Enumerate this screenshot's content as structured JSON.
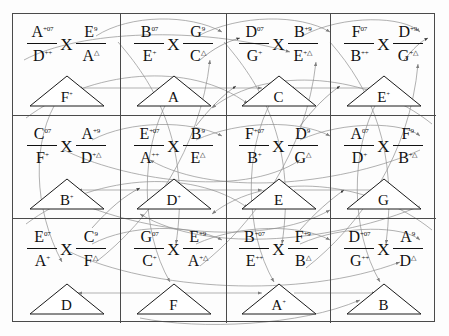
{
  "diagram": {
    "grid": {
      "rows": 3,
      "cols": 4
    },
    "colors": {
      "border": "#4a4a4a",
      "arc": "#8f8f8f",
      "text": "#111111",
      "background": "#fdfdfd"
    },
    "cells": [
      {
        "id": "r1c1",
        "num_top": "A",
        "num_top_sup": "+07",
        "den_top": "D",
        "den_top_sup": "++",
        "op": "X",
        "num_bot": "E",
        "num_bot_sup": "9",
        "den_bot": "A",
        "den_bot_sup": "△",
        "node": "F",
        "node_sup": "+"
      },
      {
        "id": "r1c2",
        "num_top": "B",
        "num_top_sup": "07",
        "den_top": "E",
        "den_top_sup": "+",
        "op": "X",
        "num_bot": "G",
        "num_bot_sup": "9",
        "den_bot": "C",
        "den_bot_sup": "△",
        "node": "A",
        "node_sup": ""
      },
      {
        "id": "r1c3",
        "num_top": "D",
        "num_top_sup": "07",
        "den_top": "G",
        "den_top_sup": "+",
        "op": "X",
        "num_bot": "B",
        "num_bot_sup": "+9",
        "den_bot": "E",
        "den_bot_sup": "+△",
        "node": "C",
        "node_sup": ""
      },
      {
        "id": "r1c4",
        "num_top": "F",
        "num_top_sup": "07",
        "den_top": "B",
        "den_top_sup": "++",
        "op": "X",
        "num_bot": "D",
        "num_bot_sup": "+9",
        "den_bot": "G",
        "den_bot_sup": "+△",
        "node": "E",
        "node_sup": "+"
      },
      {
        "id": "r2c1",
        "num_top": "C",
        "num_top_sup": "07",
        "den_top": "F",
        "den_top_sup": "+",
        "op": "X",
        "num_bot": "A",
        "num_bot_sup": "+9",
        "den_bot": "D",
        "den_bot_sup": "+△",
        "node": "B",
        "node_sup": "+"
      },
      {
        "id": "r2c2",
        "num_top": "E",
        "num_top_sup": "+07",
        "den_top": "A",
        "den_top_sup": "++",
        "op": "X",
        "num_bot": "B",
        "num_bot_sup": "9",
        "den_bot": "E",
        "den_bot_sup": "△",
        "node": "D",
        "node_sup": "+"
      },
      {
        "id": "r2c3",
        "num_top": "F",
        "num_top_sup": "+07",
        "den_top": "B",
        "den_top_sup": "+",
        "op": "X",
        "num_bot": "D",
        "num_bot_sup": "9",
        "den_bot": "G",
        "den_bot_sup": "△",
        "node": "E",
        "node_sup": ""
      },
      {
        "id": "r2c4",
        "num_top": "A",
        "num_top_sup": "07",
        "den_top": "D",
        "den_top_sup": "+",
        "op": "X",
        "num_bot": "F",
        "num_bot_sup": "9",
        "den_bot": "B",
        "den_bot_sup": "+△",
        "node": "G",
        "node_sup": ""
      },
      {
        "id": "r3c1",
        "num_top": "E",
        "num_top_sup": "07",
        "den_top": "A",
        "den_top_sup": "+",
        "op": "X",
        "num_bot": "C",
        "num_bot_sup": "9",
        "den_bot": "F",
        "den_bot_sup": "△",
        "node": "D",
        "node_sup": ""
      },
      {
        "id": "r3c2",
        "num_top": "G",
        "num_top_sup": "07",
        "den_top": "C",
        "den_top_sup": "+",
        "op": "X",
        "num_bot": "E",
        "num_bot_sup": "+9",
        "den_bot": "A",
        "den_bot_sup": "+△",
        "node": "F",
        "node_sup": ""
      },
      {
        "id": "r3c3",
        "num_top": "B",
        "num_top_sup": "+07",
        "den_top": "E",
        "den_top_sup": "++",
        "op": "X",
        "num_bot": "F",
        "num_bot_sup": "+9",
        "den_bot": "B",
        "den_bot_sup": "△",
        "node": "A",
        "node_sup": "+"
      },
      {
        "id": "r3c4",
        "num_top": "D",
        "num_top_sup": "+07",
        "den_top": "G",
        "den_top_sup": "++",
        "op": "X",
        "num_bot": "A",
        "num_bot_sup": "9",
        "den_bot": "D",
        "den_bot_sup": "△",
        "node": "B",
        "node_sup": ""
      }
    ]
  }
}
